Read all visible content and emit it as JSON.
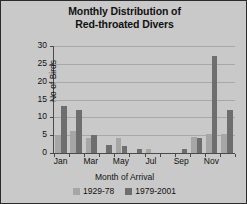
{
  "chart_data": {
    "type": "bar",
    "title": "Monthly Distribution of Red-throated Divers",
    "title_lines": [
      "Monthly Distribution of",
      "Red-throated Divers"
    ],
    "xlabel": "Month of Arrival",
    "ylabel": "No of Birds",
    "ylim": [
      0,
      30
    ],
    "ytick_labels": [
      "30",
      "25",
      "20",
      "15",
      "10",
      "5",
      "0"
    ],
    "ytick_values": [
      30,
      25,
      20,
      15,
      10,
      5,
      0
    ],
    "grid": true,
    "legend_position": "bottom",
    "categories": [
      "Jan",
      "Feb",
      "Mar",
      "Apr",
      "May",
      "Jun",
      "Jul",
      "Aug",
      "Sep",
      "Oct",
      "Nov",
      "Dec"
    ],
    "xtick_labels": [
      "Jan",
      "Mar",
      "May",
      "Jul",
      "Sep",
      "Nov"
    ],
    "series": [
      {
        "name": "1929-78",
        "color": "#a6a6a6",
        "values": [
          5.1,
          6.2,
          4.2,
          0,
          4.2,
          0,
          1.0,
          0,
          0,
          4.4,
          5.4,
          5.3
        ]
      },
      {
        "name": "1979-2001",
        "color": "#6e6e6e",
        "values": [
          13.1,
          12.1,
          5.0,
          2.3,
          2.0,
          1.0,
          0,
          0,
          1.0,
          4.3,
          27.1,
          12.2
        ]
      }
    ]
  }
}
